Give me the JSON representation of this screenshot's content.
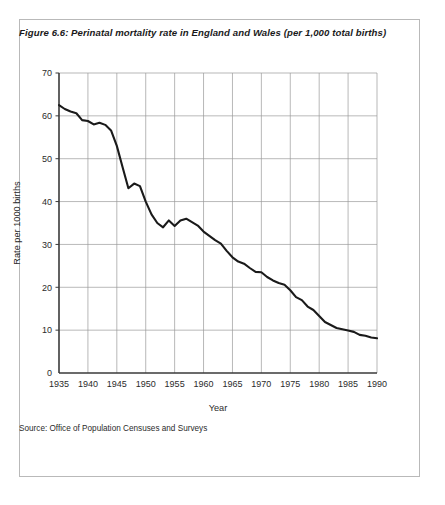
{
  "figure": {
    "number": "Figure 6.6:",
    "title": "Perinatal mortality rate in England and Wales (per 1,000 total births)",
    "source": "Source: Office of Population Censuses and Surveys"
  },
  "colors": {
    "line": "#1a1a1a",
    "grid": "#9a9a9a",
    "axis": "#3a3a3a",
    "frame": "#b9b9b9",
    "text": "#2b2b2b",
    "background": "#ffffff"
  },
  "chart_data": {
    "type": "line",
    "title": "Perinatal mortality rate in England and Wales (per 1,000 total births)",
    "xlabel": "Year",
    "ylabel": "Rate per 1000 births",
    "xlim": [
      1935,
      1990
    ],
    "ylim": [
      0,
      70
    ],
    "xticks": [
      1935,
      1940,
      1945,
      1950,
      1955,
      1960,
      1965,
      1970,
      1975,
      1980,
      1985,
      1990
    ],
    "yticks": [
      0,
      10,
      20,
      30,
      40,
      50,
      60,
      70
    ],
    "xtick_labels": [
      "1935",
      "1940",
      "1945",
      "1950",
      "1955",
      "1960",
      "1965",
      "1970",
      "1975",
      "1980",
      "1985",
      "1990"
    ],
    "ytick_labels": [
      "0",
      "10",
      "20",
      "30",
      "40",
      "50",
      "60",
      "70"
    ],
    "grid": true,
    "legend": false,
    "series": [
      {
        "name": "Perinatal mortality rate",
        "x": [
          1935,
          1936,
          1937,
          1938,
          1939,
          1940,
          1941,
          1942,
          1943,
          1944,
          1945,
          1946,
          1947,
          1948,
          1949,
          1950,
          1951,
          1952,
          1953,
          1954,
          1955,
          1956,
          1957,
          1958,
          1959,
          1960,
          1961,
          1962,
          1963,
          1964,
          1965,
          1966,
          1967,
          1968,
          1969,
          1970,
          1971,
          1972,
          1973,
          1974,
          1975,
          1976,
          1977,
          1978,
          1979,
          1980,
          1981,
          1982,
          1983,
          1984,
          1985,
          1986,
          1987,
          1988,
          1989,
          1990
        ],
        "values": [
          62.5,
          61.6,
          61.0,
          60.6,
          59.0,
          58.8,
          58.0,
          58.4,
          57.9,
          56.6,
          53.0,
          48.0,
          43.1,
          44.2,
          43.6,
          40.0,
          37.0,
          35.0,
          34.0,
          35.6,
          34.3,
          35.6,
          36.0,
          35.2,
          34.4,
          33.0,
          32.0,
          31.0,
          30.2,
          28.5,
          27.0,
          26.0,
          25.5,
          24.5,
          23.6,
          23.5,
          22.4,
          21.6,
          21.0,
          20.6,
          19.3,
          17.7,
          17.0,
          15.5,
          14.7,
          13.3,
          11.9,
          11.2,
          10.5,
          10.2,
          9.9,
          9.6,
          8.9,
          8.7,
          8.3,
          8.1
        ]
      }
    ]
  }
}
